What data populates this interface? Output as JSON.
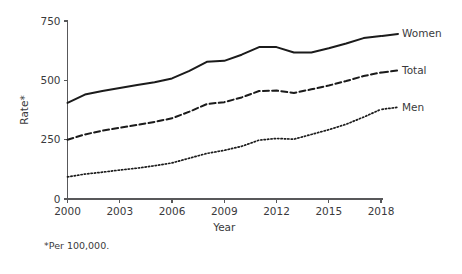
{
  "footnote": "*Per 100,000.",
  "chart_data": {
    "type": "line",
    "title": "",
    "xlabel": "Year",
    "ylabel": "Rate*",
    "x": [
      2000,
      2001,
      2002,
      2003,
      2004,
      2005,
      2006,
      2007,
      2008,
      2009,
      2010,
      2011,
      2012,
      2013,
      2014,
      2015,
      2016,
      2017,
      2018
    ],
    "xlim": [
      2000,
      2018
    ],
    "ylim": [
      0,
      750
    ],
    "xticks": [
      2000,
      2003,
      2006,
      2009,
      2012,
      2015,
      2018
    ],
    "xtick_labels": [
      "2000",
      "2003",
      "2006",
      "2009",
      "2012",
      "2015",
      "2018"
    ],
    "yticks": [
      0,
      250,
      500,
      750
    ],
    "ytick_labels": [
      "0",
      "250",
      "500",
      "750"
    ],
    "grid": false,
    "legend_position": "right-inline",
    "series": [
      {
        "name": "Women",
        "style": "solid",
        "color": "#1b1b1b",
        "values": [
          405,
          440,
          455,
          468,
          480,
          492,
          508,
          540,
          578,
          582,
          608,
          640,
          640,
          617,
          617,
          635,
          655,
          678,
          687
        ]
      },
      {
        "name": "Total",
        "style": "dashed",
        "color": "#1b1b1b",
        "values": [
          250,
          272,
          288,
          300,
          312,
          325,
          340,
          368,
          400,
          408,
          428,
          455,
          457,
          447,
          462,
          478,
          497,
          518,
          533
        ]
      },
      {
        "name": "Men",
        "style": "dotted",
        "color": "#1b1b1b",
        "values": [
          93,
          105,
          113,
          122,
          130,
          140,
          152,
          172,
          192,
          205,
          222,
          248,
          255,
          252,
          272,
          292,
          315,
          345,
          378
        ]
      }
    ]
  }
}
